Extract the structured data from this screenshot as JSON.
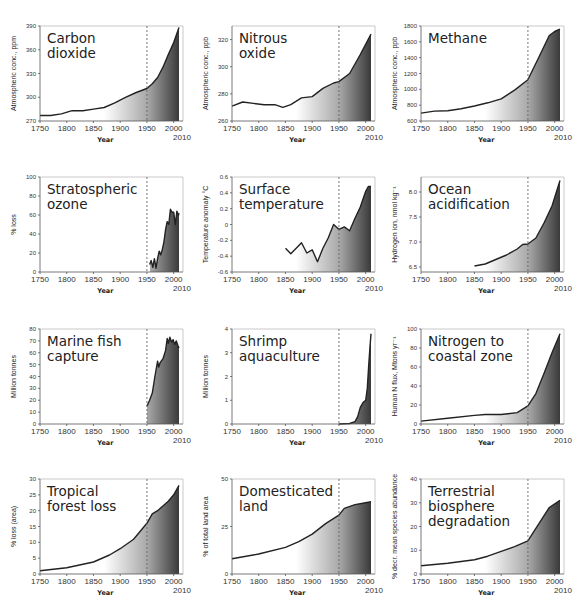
{
  "figure": {
    "x_axis_label": "Year",
    "x_ticks": [
      "1750",
      "1800",
      "1850",
      "1900",
      "1950",
      "2000"
    ],
    "x_end_label": "2010",
    "reference_line_year": 1950
  },
  "chart_data": [
    {
      "type": "area",
      "title": "Carbon dioxide",
      "title_lines": [
        "Carbon",
        "dioxide"
      ],
      "xlabel": "Year",
      "ylabel": "Atmospheric conc., ppm",
      "ylim": [
        270,
        390
      ],
      "yticks": [
        270,
        300,
        330,
        360,
        390
      ],
      "x": [
        1750,
        1770,
        1790,
        1810,
        1830,
        1850,
        1870,
        1890,
        1910,
        1930,
        1950,
        1960,
        1970,
        1980,
        1990,
        2000,
        2010
      ],
      "values": [
        277,
        277,
        279,
        283,
        283,
        285,
        287,
        293,
        300,
        306,
        311,
        317,
        325,
        338,
        354,
        369,
        388
      ]
    },
    {
      "type": "area",
      "title": "Nitrous oxide",
      "title_lines": [
        "Nitrous",
        "oxide"
      ],
      "xlabel": "Year",
      "ylabel": "Atmospheric conc., ppb",
      "ylim": [
        260,
        330
      ],
      "yticks": [
        260,
        280,
        300,
        320
      ],
      "x": [
        1750,
        1770,
        1790,
        1810,
        1830,
        1845,
        1860,
        1880,
        1900,
        1920,
        1940,
        1950,
        1970,
        1990,
        2010
      ],
      "values": [
        271,
        274,
        273,
        272,
        272,
        270,
        272,
        277,
        278,
        284,
        288,
        289,
        295,
        309,
        324
      ]
    },
    {
      "type": "area",
      "title": "Methane",
      "title_lines": [
        "Methane"
      ],
      "xlabel": "Year",
      "ylabel": "Atmospheric conc., ppb",
      "ylim": [
        600,
        1800
      ],
      "yticks": [
        600,
        800,
        1000,
        1200,
        1400,
        1600,
        1800
      ],
      "x": [
        1750,
        1775,
        1800,
        1825,
        1850,
        1875,
        1900,
        1925,
        1950,
        1970,
        1990,
        2000,
        2010
      ],
      "values": [
        700,
        725,
        730,
        755,
        790,
        830,
        880,
        990,
        1120,
        1400,
        1680,
        1730,
        1760
      ]
    },
    {
      "type": "area",
      "title": "Stratospheric ozone",
      "title_lines": [
        "Stratospheric",
        "ozone"
      ],
      "xlabel": "Year",
      "ylabel": "% loss",
      "ylim": [
        0,
        100
      ],
      "yticks": [
        0,
        20,
        40,
        60,
        80,
        100
      ],
      "x": [
        1955,
        1958,
        1961,
        1964,
        1967,
        1970,
        1973,
        1976,
        1979,
        1982,
        1985,
        1988,
        1991,
        1994,
        1997,
        2000,
        2003,
        2006,
        2009,
        2010
      ],
      "values": [
        8,
        12,
        5,
        14,
        4,
        14,
        22,
        18,
        24,
        32,
        45,
        53,
        50,
        66,
        63,
        63,
        50,
        64,
        60,
        62
      ]
    },
    {
      "type": "area",
      "title": "Surface temperature",
      "title_lines": [
        "Surface",
        "temperature"
      ],
      "xlabel": "Year",
      "ylabel": "Temperature anomaly °C",
      "ylim": [
        -0.6,
        0.6
      ],
      "yticks": [
        -0.6,
        -0.4,
        -0.2,
        0,
        0.2,
        0.4,
        0.6
      ],
      "x": [
        1850,
        1860,
        1870,
        1880,
        1890,
        1900,
        1910,
        1920,
        1930,
        1940,
        1950,
        1960,
        1970,
        1980,
        1990,
        2000,
        2005,
        2010
      ],
      "values": [
        -0.3,
        -0.37,
        -0.3,
        -0.23,
        -0.36,
        -0.32,
        -0.47,
        -0.3,
        -0.17,
        0,
        -0.06,
        -0.03,
        -0.08,
        0.08,
        0.22,
        0.42,
        0.48,
        0.48
      ]
    },
    {
      "type": "area",
      "title": "Ocean acidification",
      "title_lines": [
        "Ocean",
        "acidification"
      ],
      "xlabel": "Year",
      "ylabel": "Hydrogen ion, nmol kg⁻¹",
      "ylim": [
        6.4,
        8.3
      ],
      "yticks": [
        6.5,
        7.0,
        7.5,
        8.0
      ],
      "x": [
        1850,
        1870,
        1890,
        1910,
        1930,
        1940,
        1950,
        1965,
        1980,
        1995,
        2010
      ],
      "values": [
        6.52,
        6.56,
        6.65,
        6.74,
        6.86,
        6.95,
        6.96,
        7.08,
        7.38,
        7.72,
        8.23
      ]
    },
    {
      "type": "area",
      "title": "Marine fish capture",
      "title_lines": [
        "Marine fish",
        "capture"
      ],
      "xlabel": "Year",
      "ylabel": "Million tonnes",
      "ylim": [
        0,
        80
      ],
      "yticks": [
        0,
        10,
        20,
        30,
        40,
        50,
        60,
        70,
        80
      ],
      "x": [
        1950,
        1955,
        1960,
        1965,
        1970,
        1972,
        1975,
        1980,
        1985,
        1988,
        1990,
        1993,
        1996,
        1999,
        2002,
        2005,
        2008,
        2010
      ],
      "values": [
        15,
        20,
        26,
        40,
        53,
        48,
        52,
        55,
        62,
        72,
        68,
        73,
        69,
        71,
        67,
        70,
        66,
        64
      ]
    },
    {
      "type": "area",
      "title": "Shrimp aquaculture",
      "title_lines": [
        "Shrimp",
        "aquaculture"
      ],
      "xlabel": "Year",
      "ylabel": "Million tonnes",
      "ylim": [
        0,
        4
      ],
      "yticks": [
        0,
        1,
        2,
        3,
        4
      ],
      "x": [
        1950,
        1970,
        1980,
        1985,
        1990,
        1995,
        2000,
        2003,
        2006,
        2008,
        2010
      ],
      "values": [
        0,
        0.02,
        0.1,
        0.3,
        0.7,
        0.9,
        1.0,
        1.5,
        2.6,
        3.2,
        3.8
      ]
    },
    {
      "type": "area",
      "title": "Nitrogen to coastal zone",
      "title_lines": [
        "Nitrogen to",
        "coastal zone"
      ],
      "xlabel": "Year",
      "ylabel": "Human N flux, Mtons yr⁻¹",
      "ylim": [
        0,
        100
      ],
      "yticks": [
        0,
        20,
        40,
        60,
        80,
        100
      ],
      "x": [
        1750,
        1800,
        1850,
        1870,
        1900,
        1930,
        1950,
        1965,
        1980,
        1995,
        2010
      ],
      "values": [
        3,
        6,
        9,
        10,
        10,
        12,
        19,
        32,
        53,
        75,
        95
      ]
    },
    {
      "type": "area",
      "title": "Tropical forest loss",
      "title_lines": [
        "Tropical",
        "forest loss"
      ],
      "xlabel": "Year",
      "ylabel": "% loss (area)",
      "ylim": [
        0,
        30
      ],
      "yticks": [
        0,
        5,
        10,
        15,
        20,
        25,
        30
      ],
      "x": [
        1750,
        1800,
        1850,
        1880,
        1900,
        1925,
        1950,
        1960,
        1970,
        1990,
        2000,
        2010
      ],
      "values": [
        1,
        2,
        3.8,
        6,
        8,
        11,
        16,
        19,
        20,
        23,
        25,
        28
      ]
    },
    {
      "type": "area",
      "title": "Domesticated land",
      "title_lines": [
        "Domesticated",
        "land"
      ],
      "xlabel": "Year",
      "ylabel": "% of total land area",
      "ylim": [
        0,
        50
      ],
      "yticks": [
        0,
        25,
        50
      ],
      "x": [
        1750,
        1800,
        1850,
        1875,
        1900,
        1925,
        1950,
        1960,
        1980,
        2000,
        2010
      ],
      "values": [
        8,
        10.5,
        14,
        17,
        21,
        26.5,
        31,
        34.5,
        36.5,
        37.5,
        38
      ]
    },
    {
      "type": "area",
      "title": "Terrestrial biosphere degradation",
      "title_lines": [
        "Terrestrial",
        "biosphere",
        "degradation"
      ],
      "xlabel": "Year",
      "ylabel": "% decr. mean species abundance",
      "ylim": [
        0,
        40
      ],
      "yticks": [
        0,
        10,
        20,
        30,
        40
      ],
      "x": [
        1750,
        1800,
        1850,
        1875,
        1900,
        1925,
        1950,
        1970,
        1990,
        2010
      ],
      "values": [
        3.5,
        4.5,
        6,
        7.5,
        9.5,
        11.5,
        14,
        21,
        28,
        31
      ]
    }
  ]
}
